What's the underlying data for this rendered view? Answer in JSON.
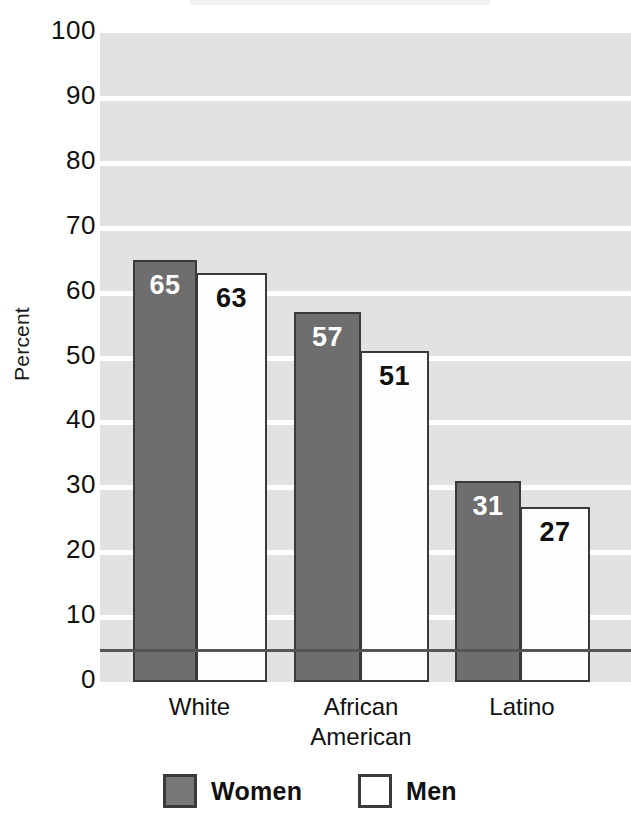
{
  "chart_data": {
    "type": "bar",
    "title": "",
    "subtitle": "",
    "xlabel": "",
    "ylabel": "Percent",
    "ylim": [
      0,
      100
    ],
    "ytick_step": 10,
    "yticks": [
      100,
      90,
      80,
      70,
      60,
      50,
      40,
      30,
      20,
      10,
      0
    ],
    "ytick_labels": [
      "100",
      "90",
      "80",
      "70",
      "60",
      "50",
      "40",
      "30",
      "20",
      "10",
      "0"
    ],
    "categories": [
      "White",
      "African American",
      "Latino"
    ],
    "category_label_lines": [
      [
        "White"
      ],
      [
        "African",
        "American"
      ],
      [
        "Latino"
      ]
    ],
    "series": [
      {
        "name": "Women",
        "values": [
          65,
          63,
          31
        ],
        "value_labels": [
          "65",
          "57",
          "31"
        ],
        "color": "#6e6e6e"
      },
      {
        "name": "Men",
        "values": [
          63,
          51,
          27
        ],
        "value_labels": [
          "63",
          "51",
          "27"
        ],
        "color": "#ffffff"
      }
    ],
    "grid": true,
    "grid_orientation": "horizontal",
    "legend_position": "bottom",
    "plot_background": "#e2e2e2",
    "bar_border_color": "#3a3a3a"
  },
  "bars": [
    {
      "group": "White",
      "series": "Women",
      "value": 65,
      "label": "65",
      "left": 33,
      "width": 64
    },
    {
      "group": "White",
      "series": "Men",
      "value": 63,
      "label": "63",
      "left": 96,
      "width": 71
    },
    {
      "group": "African American",
      "series": "Women",
      "value": 57,
      "label": "57",
      "left": 194,
      "width": 67
    },
    {
      "group": "African American",
      "series": "Men",
      "value": 51,
      "label": "51",
      "left": 260,
      "width": 69
    },
    {
      "group": "Latino",
      "series": "Women",
      "value": 31,
      "label": "31",
      "left": 355,
      "width": 66
    },
    {
      "group": "Latino",
      "series": "Men",
      "value": 27,
      "label": "27",
      "left": 420,
      "width": 70
    }
  ],
  "category_positions": [
    {
      "label_lines": [
        "White"
      ],
      "left": 133,
      "width": 133
    },
    {
      "label_lines": [
        "African",
        "American"
      ],
      "left": 294,
      "width": 134
    },
    {
      "label_lines": [
        "Latino"
      ],
      "left": 455,
      "width": 134
    }
  ],
  "legend": {
    "items": [
      {
        "label": "Women",
        "swatch": "women-swatch"
      },
      {
        "label": "Men",
        "swatch": "men-swatch"
      }
    ]
  }
}
